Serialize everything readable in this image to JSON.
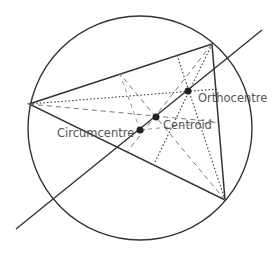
{
  "diagram": {
    "circle": {
      "cx": 140,
      "cy": 128,
      "r": 112
    },
    "vertices": {
      "A": [
        29,
        104
      ],
      "B": [
        212,
        44
      ],
      "C": [
        225,
        200
      ]
    },
    "euler_line": {
      "from": [
        16,
        229
      ],
      "to": [
        262,
        30
      ]
    },
    "points": [
      {
        "name": "Orthocentre",
        "x": 188,
        "y": 91,
        "label_x": 198,
        "label_y": 102
      },
      {
        "name": "Centroid",
        "x": 156,
        "y": 117,
        "label_x": 163,
        "label_y": 128
      },
      {
        "name": "Circumcentre",
        "x": 140,
        "y": 130,
        "label_x": 57,
        "label_y": 137
      }
    ],
    "labels": {
      "orthocentre": "Orthocentre",
      "centroid": "Centroid",
      "circumcentre": "Circumcentre"
    },
    "colors": {
      "line": "#333333",
      "text": "#555555",
      "dash": "#777777"
    }
  }
}
